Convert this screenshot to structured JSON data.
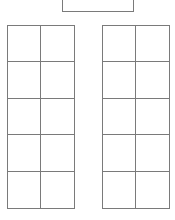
{
  "diagram": {
    "top_box": {
      "label": ""
    },
    "left_grid": {
      "rows": 5,
      "cols": 2,
      "cells": [
        [
          "",
          ""
        ],
        [
          "",
          ""
        ],
        [
          "",
          ""
        ],
        [
          "",
          ""
        ],
        [
          "",
          ""
        ]
      ]
    },
    "right_grid": {
      "rows": 5,
      "cols": 2,
      "cells": [
        [
          "",
          ""
        ],
        [
          "",
          ""
        ],
        [
          "",
          ""
        ],
        [
          "",
          ""
        ],
        [
          "",
          ""
        ]
      ]
    },
    "line_color": "#7a7a7a",
    "background": "#ffffff"
  }
}
